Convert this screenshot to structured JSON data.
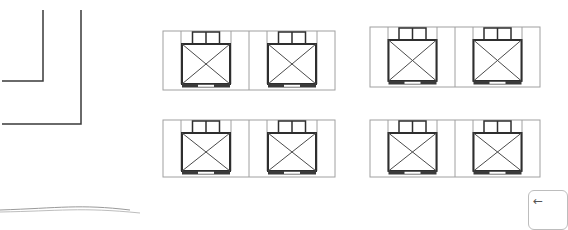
{
  "floorplan": {
    "colors": {
      "wall": "#3a3a3a",
      "frame": "#a0a0a0",
      "desk": "#2e2e2e",
      "desk_diagonal": "#4a4a4a",
      "chair": "#2e2e2e",
      "base_fill": "#3a3a3a",
      "base_slot": "#ffffff"
    },
    "walls": [
      {
        "name": "inner-wall",
        "points": [
          [
            43,
            10
          ],
          [
            43,
            81
          ],
          [
            2,
            81
          ]
        ]
      },
      {
        "name": "outer-wall",
        "points": [
          [
            81,
            10
          ],
          [
            81,
            124
          ],
          [
            2,
            124
          ]
        ]
      }
    ],
    "workstation_groups": [
      {
        "name": "group-top-left",
        "x": 163,
        "y": 31,
        "width": 172,
        "height": 59
      },
      {
        "name": "group-top-right",
        "x": 370,
        "y": 27,
        "width": 170,
        "height": 60
      },
      {
        "name": "group-bottom-left",
        "x": 163,
        "y": 120,
        "width": 172,
        "height": 57
      },
      {
        "name": "group-bottom-right",
        "x": 370,
        "y": 120,
        "width": 170,
        "height": 57
      }
    ]
  },
  "controls": {
    "back_button": {
      "icon": "arrow-left-icon",
      "glyph": "←"
    }
  }
}
